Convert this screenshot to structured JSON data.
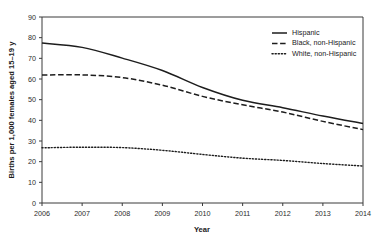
{
  "chart_data": {
    "type": "line",
    "title": "",
    "subtitle": "",
    "xlabel": "Year",
    "ylabel": "Births per 1,000 females aged 15–19 y",
    "x": [
      2006,
      2007,
      2008,
      2009,
      2010,
      2011,
      2012,
      2013,
      2014
    ],
    "xticklabels": [
      "2006",
      "2007",
      "2008",
      "2009",
      "2010",
      "2011",
      "2012",
      "2013",
      "2014"
    ],
    "yticklabels": [
      "0",
      "10",
      "20",
      "30",
      "40",
      "50",
      "60",
      "70",
      "80",
      "90"
    ],
    "yticks": [
      0,
      10,
      20,
      30,
      40,
      50,
      60,
      70,
      80,
      90
    ],
    "xlim": [
      2006,
      2014
    ],
    "ylim": [
      0,
      90
    ],
    "grid": false,
    "legend_position": "top-right",
    "series": [
      {
        "name": "Hispanic",
        "style": "solid",
        "color": "#1d1d1d",
        "values": [
          77.4,
          75.3,
          70.1,
          64.1,
          55.9,
          49.7,
          46.1,
          42.1,
          38.5
        ]
      },
      {
        "name": "Black, non-Hispanic",
        "style": "dashed",
        "color": "#1d1d1d",
        "values": [
          61.9,
          62.0,
          60.7,
          57.0,
          51.6,
          47.5,
          44.0,
          39.5,
          35.5
        ]
      },
      {
        "name": "White, non-Hispanic",
        "style": "dotted",
        "color": "#1d1d1d",
        "values": [
          26.7,
          27.0,
          26.8,
          25.5,
          23.5,
          21.7,
          20.6,
          19.1,
          17.9
        ]
      }
    ]
  },
  "axes": {
    "y_axis_title": "Births per 1,000 females aged 15–19 y",
    "x_axis_title": "Year"
  },
  "legend": {
    "items": [
      {
        "label": "Hispanic",
        "style": "solid"
      },
      {
        "label": "Black, non-Hispanic",
        "style": "dashed"
      },
      {
        "label": "White, non-Hispanic",
        "style": "dotted"
      }
    ]
  },
  "colors": {
    "ink": "#1d1d1d",
    "axis": "#3a3a3a",
    "background": "#ffffff"
  }
}
